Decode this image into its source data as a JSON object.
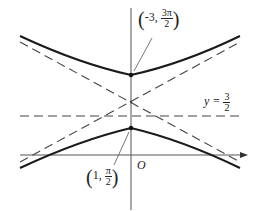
{
  "diagram": {
    "type": "hyperbola-with-asymptotes",
    "axes": {
      "origin_label": "O"
    },
    "upper_vertex": {
      "x": "-3",
      "y_num": "3π",
      "y_den": "2"
    },
    "lower_vertex": {
      "x": "1",
      "y_num": "π",
      "y_den": "2"
    },
    "horizontal_line": {
      "lhs": "y =",
      "num": "3",
      "den": "2"
    },
    "colors": {
      "curve": "#1a1a1a",
      "axis": "#555555",
      "dashed": "#444444"
    }
  }
}
